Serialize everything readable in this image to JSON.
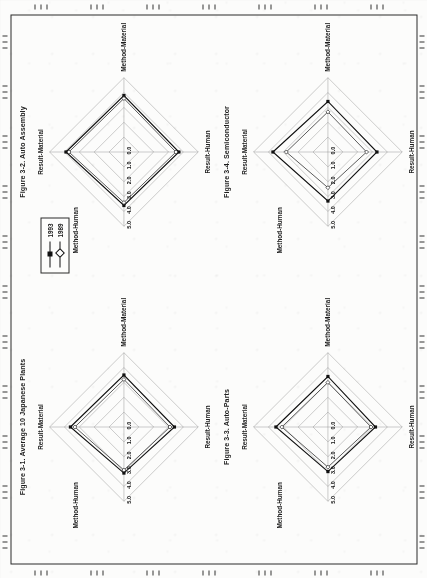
{
  "page": {
    "orientation": "landscape-rotated-90ccw",
    "background_color": "#fcfcfb",
    "border_color": "#2a2a2a"
  },
  "legend": {
    "entries": [
      {
        "label": "1993",
        "marker": "filled-square-marker",
        "color": "#111111"
      },
      {
        "label": "1989",
        "marker": "open-diamond-marker",
        "color": "#333333"
      }
    ]
  },
  "axes": {
    "labels": {
      "top": "Result-Material",
      "right": "Method-Material",
      "bottom": "Result-Human",
      "left": "Method-Human"
    },
    "tick_labels": [
      "0.0",
      "1.0",
      "2.0",
      "3.0",
      "4.0",
      "5.0"
    ],
    "min": 0.0,
    "max": 5.0
  },
  "figures": [
    {
      "id": "fig-3-1",
      "title": "Figure 3-1. Average 10 Japanese Plants",
      "chart_data": {
        "type": "radar",
        "title": "Figure 3-1. Average 10 Japanese Plants",
        "categories": [
          "Result-Material",
          "Method-Material",
          "Result-Human",
          "Method-Human"
        ],
        "rlim": [
          0.0,
          5.0
        ],
        "rticks": [
          0.0,
          1.0,
          2.0,
          3.0,
          4.0,
          5.0
        ],
        "grid": true,
        "legend_position": "outside-top-left",
        "series": [
          {
            "name": "1993",
            "values": [
              3.6,
              3.5,
              3.4,
              3.1
            ]
          },
          {
            "name": "1989",
            "values": [
              3.3,
              3.2,
              3.1,
              2.9
            ]
          }
        ]
      }
    },
    {
      "id": "fig-3-2",
      "title": "Figure 3-2. Auto Assembly",
      "chart_data": {
        "type": "radar",
        "title": "Figure 3-2. Auto Assembly",
        "categories": [
          "Result-Material",
          "Method-Material",
          "Result-Human",
          "Method-Human"
        ],
        "rlim": [
          0.0,
          5.0
        ],
        "rticks": [
          0.0,
          1.0,
          2.0,
          3.0,
          4.0,
          5.0
        ],
        "grid": true,
        "legend_position": "outside-top-left",
        "series": [
          {
            "name": "1993",
            "values": [
              3.9,
              3.8,
              3.7,
              3.6
            ]
          },
          {
            "name": "1989",
            "values": [
              3.7,
              3.6,
              3.5,
              3.4
            ]
          }
        ]
      }
    },
    {
      "id": "fig-3-3",
      "title": "Figure 3-3. Auto-Parts",
      "chart_data": {
        "type": "radar",
        "title": "Figure 3-3. Auto-Parts",
        "categories": [
          "Result-Material",
          "Method-Material",
          "Result-Human",
          "Method-Human"
        ],
        "rlim": [
          0.0,
          5.0
        ],
        "rticks": [
          0.0,
          1.0,
          2.0,
          3.0,
          4.0,
          5.0
        ],
        "grid": true,
        "legend_position": "outside-top-left",
        "series": [
          {
            "name": "1993",
            "values": [
              3.5,
              3.4,
              3.2,
              3.0
            ]
          },
          {
            "name": "1989",
            "values": [
              3.1,
              3.0,
              2.9,
              2.7
            ]
          }
        ]
      }
    },
    {
      "id": "fig-3-4",
      "title": "Figure 3-4. Semiconductor",
      "chart_data": {
        "type": "radar",
        "title": "Figure 3-4. Semiconductor",
        "categories": [
          "Result-Material",
          "Method-Material",
          "Result-Human",
          "Method-Human"
        ],
        "rlim": [
          0.0,
          5.0
        ],
        "rticks": [
          0.0,
          1.0,
          2.0,
          3.0,
          4.0,
          5.0
        ],
        "grid": true,
        "legend_position": "outside-top-left",
        "series": [
          {
            "name": "1993",
            "values": [
              3.7,
              3.4,
              3.3,
              3.3
            ]
          },
          {
            "name": "1989",
            "values": [
              2.8,
              2.7,
              2.6,
              2.4
            ]
          }
        ]
      }
    }
  ]
}
